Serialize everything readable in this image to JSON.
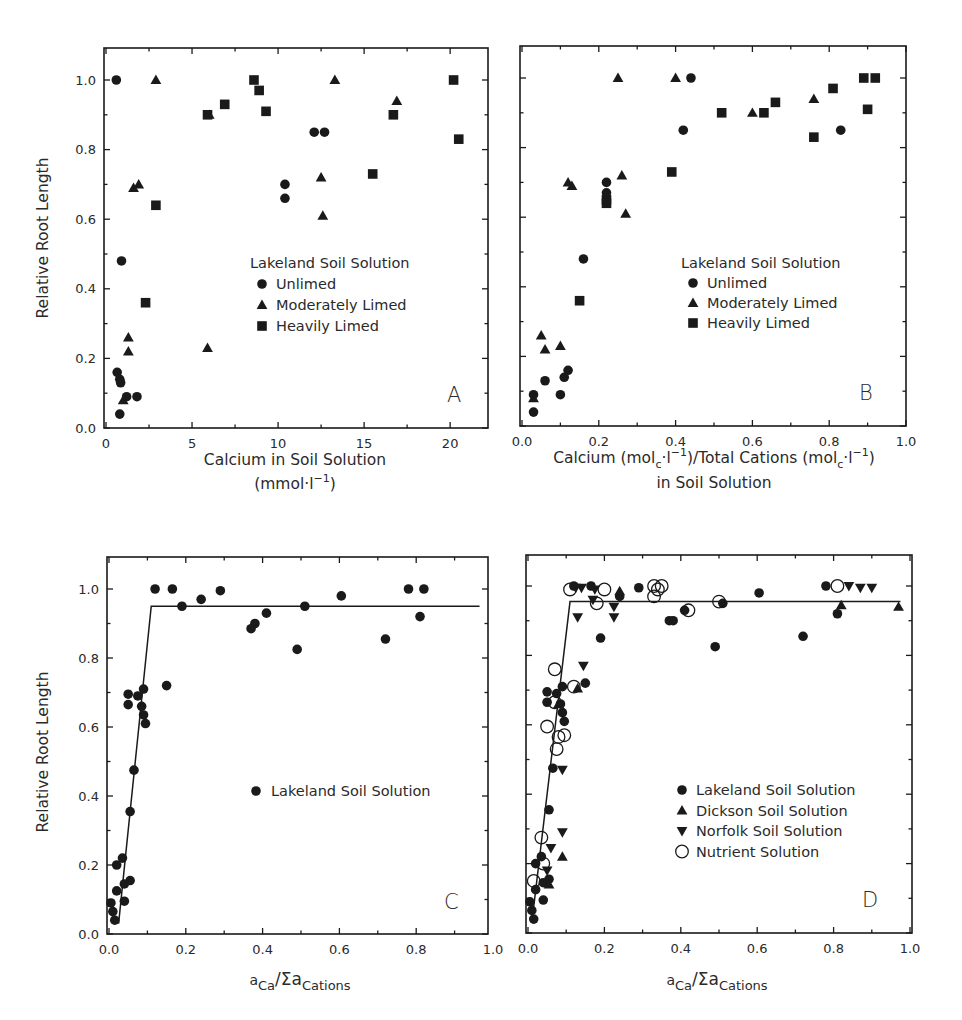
{
  "figure": {
    "header_fragment": "",
    "panels_count": 4
  },
  "chart_data": [
    {
      "id": "A",
      "type": "scatter",
      "panel_label": "A",
      "title": "",
      "xlabel": "Calcium in Soil Solution",
      "xlabel_line2": "(mmol·l⁻¹)",
      "ylabel": "Relative Root Length",
      "xlim": [
        0,
        22.2
      ],
      "ylim": [
        0,
        1.09
      ],
      "xticks": [
        0,
        5,
        10,
        15,
        20
      ],
      "xtick_labels": [
        "0",
        "5",
        "10",
        "15",
        "20"
      ],
      "x_minor_ticks": [
        2.5,
        7.5,
        12.5,
        17.5
      ],
      "yticks": [
        0.0,
        0.2,
        0.4,
        0.6,
        0.8,
        1.0
      ],
      "ytick_labels": [
        "0.0",
        "0.2",
        "0.4",
        "0.6",
        "0.8",
        "1.0"
      ],
      "y_minor_ticks": [
        0.1,
        0.3,
        0.5,
        0.7,
        0.9
      ],
      "grid": false,
      "legend": {
        "title": "Lakeland Soil Solution",
        "position": "center-right",
        "entries": [
          "Unlimed",
          "Moderately Limed",
          "Heavily Limed"
        ]
      },
      "series": [
        {
          "name": "Unlimed",
          "marker": "circle-filled",
          "points": [
            [
              0.6,
              1.0
            ],
            [
              0.9,
              0.48
            ],
            [
              0.65,
              0.16
            ],
            [
              0.8,
              0.14
            ],
            [
              0.85,
              0.13
            ],
            [
              1.2,
              0.09
            ],
            [
              1.8,
              0.09
            ],
            [
              0.8,
              0.04
            ],
            [
              10.4,
              0.7
            ],
            [
              10.4,
              0.66
            ],
            [
              12.1,
              0.85
            ],
            [
              12.7,
              0.85
            ]
          ]
        },
        {
          "name": "Moderately Limed",
          "marker": "triangle-up-filled",
          "points": [
            [
              2.9,
              1.0
            ],
            [
              13.3,
              1.0
            ],
            [
              16.9,
              0.94
            ],
            [
              6.0,
              0.9
            ],
            [
              1.6,
              0.69
            ],
            [
              1.9,
              0.7
            ],
            [
              12.5,
              0.72
            ],
            [
              12.6,
              0.61
            ],
            [
              1.3,
              0.26
            ],
            [
              1.3,
              0.22
            ],
            [
              5.9,
              0.23
            ],
            [
              1.0,
              0.08
            ]
          ]
        },
        {
          "name": "Heavily Limed",
          "marker": "square-filled",
          "points": [
            [
              8.6,
              1.0
            ],
            [
              20.2,
              1.0
            ],
            [
              8.9,
              0.97
            ],
            [
              6.9,
              0.93
            ],
            [
              5.9,
              0.9
            ],
            [
              9.3,
              0.91
            ],
            [
              16.7,
              0.9
            ],
            [
              20.5,
              0.83
            ],
            [
              15.5,
              0.73
            ],
            [
              2.9,
              0.64
            ],
            [
              2.3,
              0.36
            ]
          ]
        }
      ]
    },
    {
      "id": "B",
      "type": "scatter",
      "panel_label": "B",
      "title": "",
      "xlabel": "Calcium (mol",
      "xlabel_sub": "c",
      "xlabel_mid": "·l",
      "xlabel_sup": "−1",
      "xlabel_mid2": ")/Total Cations (mol",
      "xlabel_end": ")",
      "xlabel_line2": "in Soil Solution",
      "ylabel": "",
      "xlim": [
        0,
        1.0
      ],
      "ylim": [
        0,
        1.09
      ],
      "xticks": [
        0.0,
        0.2,
        0.4,
        0.6,
        0.8,
        1.0
      ],
      "xtick_labels": [
        "0.0",
        "0.2",
        "0.4",
        "0.6",
        "0.8",
        "1.0"
      ],
      "x_minor_ticks": [
        0.1,
        0.3,
        0.5,
        0.7,
        0.9
      ],
      "yticks": [
        0.0,
        0.2,
        0.4,
        0.6,
        0.8,
        1.0
      ],
      "ytick_labels": [],
      "y_minor_ticks": [
        0.1,
        0.3,
        0.5,
        0.7,
        0.9
      ],
      "grid": false,
      "legend": {
        "title": "Lakeland Soil Solution",
        "position": "center-right",
        "entries": [
          "Unlimed",
          "Moderately Limed",
          "Heavily Limed"
        ]
      },
      "series": [
        {
          "name": "Unlimed",
          "marker": "circle-filled",
          "points": [
            [
              0.44,
              1.0
            ],
            [
              0.42,
              0.85
            ],
            [
              0.83,
              0.85
            ],
            [
              0.22,
              0.7
            ],
            [
              0.22,
              0.67
            ],
            [
              0.16,
              0.48
            ],
            [
              0.12,
              0.16
            ],
            [
              0.11,
              0.14
            ],
            [
              0.06,
              0.13
            ],
            [
              0.1,
              0.09
            ],
            [
              0.03,
              0.09
            ],
            [
              0.03,
              0.04
            ]
          ]
        },
        {
          "name": "Moderately Limed",
          "marker": "triangle-up-filled",
          "points": [
            [
              0.25,
              1.0
            ],
            [
              0.4,
              1.0
            ],
            [
              0.76,
              0.94
            ],
            [
              0.6,
              0.9
            ],
            [
              0.12,
              0.7
            ],
            [
              0.13,
              0.69
            ],
            [
              0.26,
              0.72
            ],
            [
              0.27,
              0.61
            ],
            [
              0.05,
              0.26
            ],
            [
              0.06,
              0.22
            ],
            [
              0.1,
              0.23
            ],
            [
              0.03,
              0.08
            ]
          ]
        },
        {
          "name": "Heavily Limed",
          "marker": "square-filled",
          "points": [
            [
              0.89,
              1.0
            ],
            [
              0.92,
              1.0
            ],
            [
              0.81,
              0.97
            ],
            [
              0.66,
              0.93
            ],
            [
              0.52,
              0.9
            ],
            [
              0.63,
              0.9
            ],
            [
              0.9,
              0.91
            ],
            [
              0.76,
              0.83
            ],
            [
              0.39,
              0.73
            ],
            [
              0.22,
              0.65
            ],
            [
              0.22,
              0.64
            ],
            [
              0.15,
              0.36
            ]
          ]
        }
      ]
    },
    {
      "id": "C",
      "type": "scatter",
      "panel_label": "C",
      "title": "",
      "xlabel": "a",
      "xlabel_sub": "Ca",
      "xlabel_mid": "/Σa",
      "xlabel_sub2": "Cations",
      "ylabel": "Relative Root Length",
      "xlim": [
        0,
        0.987
      ],
      "ylim": [
        0,
        1.09
      ],
      "xticks": [
        0.0,
        0.2,
        0.4,
        0.6,
        0.8,
        1.0
      ],
      "xtick_labels": [
        "0.0",
        "0.2",
        "0.4",
        "0.6",
        "0.8",
        "1.0"
      ],
      "x_minor_ticks": [
        0.1,
        0.3,
        0.5,
        0.7,
        0.9
      ],
      "yticks": [
        0.0,
        0.2,
        0.4,
        0.6,
        0.8,
        1.0
      ],
      "ytick_labels": [
        "0.0",
        "0.2",
        "0.4",
        "0.6",
        "0.8",
        "1.0"
      ],
      "y_minor_ticks": [
        0.1,
        0.3,
        0.5,
        0.7,
        0.9
      ],
      "grid": false,
      "fit_line": {
        "points": [
          [
            0.025,
            0.03
          ],
          [
            0.11,
            0.95
          ],
          [
            0.965,
            0.95
          ]
        ]
      },
      "legend": {
        "title": "",
        "position": "center-right",
        "entries": [
          "Lakeland Soil Solution"
        ]
      },
      "series": [
        {
          "name": "Lakeland Soil Solution",
          "marker": "circle-filled",
          "points": [
            [
              0.12,
              1.0
            ],
            [
              0.165,
              1.0
            ],
            [
              0.29,
              0.995
            ],
            [
              0.78,
              1.0
            ],
            [
              0.82,
              1.0
            ],
            [
              0.24,
              0.97
            ],
            [
              0.605,
              0.98
            ],
            [
              0.19,
              0.95
            ],
            [
              0.51,
              0.95
            ],
            [
              0.81,
              0.92
            ],
            [
              0.41,
              0.93
            ],
            [
              0.38,
              0.9
            ],
            [
              0.37,
              0.885
            ],
            [
              0.72,
              0.855
            ],
            [
              0.49,
              0.825
            ],
            [
              0.15,
              0.72
            ],
            [
              0.05,
              0.695
            ],
            [
              0.05,
              0.665
            ],
            [
              0.075,
              0.69
            ],
            [
              0.09,
              0.71
            ],
            [
              0.085,
              0.66
            ],
            [
              0.09,
              0.635
            ],
            [
              0.095,
              0.61
            ],
            [
              0.065,
              0.475
            ],
            [
              0.055,
              0.355
            ],
            [
              0.035,
              0.22
            ],
            [
              0.02,
              0.2
            ],
            [
              0.055,
              0.155
            ],
            [
              0.04,
              0.145
            ],
            [
              0.02,
              0.125
            ],
            [
              0.04,
              0.095
            ],
            [
              0.005,
              0.09
            ],
            [
              0.01,
              0.065
            ],
            [
              0.015,
              0.04
            ]
          ]
        }
      ]
    },
    {
      "id": "D",
      "type": "scatter",
      "panel_label": "D",
      "title": "",
      "xlabel": "a",
      "xlabel_sub": "Ca",
      "xlabel_mid": "/Σa",
      "xlabel_sub2": "Cations",
      "ylabel": "",
      "xlim": [
        0,
        1.0
      ],
      "ylim": [
        0,
        1.09
      ],
      "xticks": [
        0.0,
        0.2,
        0.4,
        0.6,
        0.8,
        1.0
      ],
      "xtick_labels": [
        "0.0",
        "0.2",
        "0.4",
        "0.6",
        "0.8",
        "1.0"
      ],
      "x_minor_ticks": [
        0.1,
        0.3,
        0.5,
        0.7,
        0.9
      ],
      "yticks": [
        0.0,
        0.2,
        0.4,
        0.6,
        0.8,
        1.0
      ],
      "ytick_labels": [],
      "y_minor_ticks": [
        0.1,
        0.3,
        0.5,
        0.7,
        0.9
      ],
      "grid": false,
      "fit_line": {
        "points": [
          [
            0.01,
            0.03
          ],
          [
            0.11,
            0.955
          ],
          [
            0.975,
            0.955
          ]
        ]
      },
      "legend": {
        "title": "",
        "position": "center-right",
        "entries": [
          "Lakeland Soil Solution",
          "Dickson Soil Solution",
          "Norfolk Soil Solution",
          "Nutrient Solution"
        ]
      },
      "series": [
        {
          "name": "Lakeland Soil Solution",
          "marker": "circle-filled",
          "points": [
            [
              0.12,
              1.0
            ],
            [
              0.165,
              1.0
            ],
            [
              0.29,
              0.995
            ],
            [
              0.78,
              1.0
            ],
            [
              0.24,
              0.97
            ],
            [
              0.605,
              0.98
            ],
            [
              0.51,
              0.95
            ],
            [
              0.81,
              0.92
            ],
            [
              0.41,
              0.93
            ],
            [
              0.37,
              0.9
            ],
            [
              0.38,
              0.9
            ],
            [
              0.72,
              0.855
            ],
            [
              0.49,
              0.825
            ],
            [
              0.19,
              0.85
            ],
            [
              0.15,
              0.72
            ],
            [
              0.05,
              0.695
            ],
            [
              0.05,
              0.665
            ],
            [
              0.075,
              0.69
            ],
            [
              0.09,
              0.71
            ],
            [
              0.085,
              0.66
            ],
            [
              0.09,
              0.635
            ],
            [
              0.095,
              0.61
            ],
            [
              0.065,
              0.475
            ],
            [
              0.055,
              0.355
            ],
            [
              0.035,
              0.22
            ],
            [
              0.02,
              0.2
            ],
            [
              0.055,
              0.155
            ],
            [
              0.04,
              0.145
            ],
            [
              0.02,
              0.125
            ],
            [
              0.04,
              0.095
            ],
            [
              0.005,
              0.09
            ],
            [
              0.01,
              0.065
            ],
            [
              0.015,
              0.04
            ]
          ]
        },
        {
          "name": "Dickson Soil Solution",
          "marker": "triangle-up-filled",
          "points": [
            [
              0.24,
              0.985
            ],
            [
              0.82,
              0.945
            ],
            [
              0.97,
              0.94
            ],
            [
              0.13,
              0.705
            ],
            [
              0.08,
              0.66
            ],
            [
              0.055,
              0.14
            ],
            [
              0.09,
              0.22
            ]
          ]
        },
        {
          "name": "Norfolk Soil Solution",
          "marker": "triangle-down-filled",
          "points": [
            [
              0.125,
              0.995
            ],
            [
              0.14,
              0.995
            ],
            [
              0.175,
              0.99
            ],
            [
              0.84,
              1.0
            ],
            [
              0.87,
              0.995
            ],
            [
              0.9,
              0.995
            ],
            [
              0.17,
              0.96
            ],
            [
              0.225,
              0.94
            ],
            [
              0.13,
              0.91
            ],
            [
              0.225,
              0.91
            ],
            [
              0.145,
              0.77
            ],
            [
              0.09,
              0.47
            ],
            [
              0.09,
              0.29
            ],
            [
              0.06,
              0.245
            ],
            [
              0.05,
              0.18
            ]
          ]
        },
        {
          "name": "Nutrient Solution",
          "marker": "circle-open",
          "points": [
            [
              0.11,
              0.99
            ],
            [
              0.2,
              0.99
            ],
            [
              0.33,
              1.0
            ],
            [
              0.35,
              1.0
            ],
            [
              0.34,
              0.99
            ],
            [
              0.33,
              0.97
            ],
            [
              0.81,
              1.0
            ],
            [
              0.18,
              0.95
            ],
            [
              0.42,
              0.93
            ],
            [
              0.5,
              0.955
            ],
            [
              0.07,
              0.76
            ],
            [
              0.12,
              0.71
            ],
            [
              0.07,
              0.665
            ],
            [
              0.05,
              0.595
            ],
            [
              0.08,
              0.565
            ],
            [
              0.095,
              0.57
            ],
            [
              0.075,
              0.53
            ],
            [
              0.035,
              0.275
            ],
            [
              0.04,
              0.2
            ],
            [
              0.015,
              0.15
            ]
          ]
        }
      ]
    }
  ]
}
